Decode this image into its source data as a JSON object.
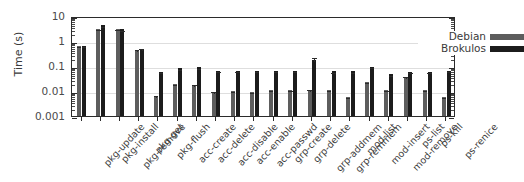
{
  "chart_data": {
    "type": "bar",
    "title": "",
    "xlabel": "",
    "ylabel": "Time (s)",
    "yscale": "log",
    "ylim": [
      0.001,
      10
    ],
    "ytick_labels": [
      "10",
      "1",
      "0.1",
      "0.01",
      "0.001"
    ],
    "ytick_values": [
      10,
      1,
      0.1,
      0.01,
      0.001
    ],
    "grid": true,
    "legend_position": "top-right",
    "categories": [
      "pkg-update",
      "pkg-install",
      "pkg-remove",
      "pkg-get",
      "pkg-flush",
      "acc-create",
      "acc-delete",
      "acc-disable",
      "acc-enable",
      "acc-passwd",
      "grp-create",
      "grp-delete",
      "grp-addmem",
      "grp-remmem",
      "mod-list",
      "mod-insert",
      "mod-remove",
      "ps-list",
      "ps-kill",
      "ps-renice"
    ],
    "series": [
      {
        "name": "Debian",
        "color": "#5d5d5d",
        "values": [
          0.63,
          3.1,
          2.9,
          0.45,
          0.0065,
          0.019,
          0.018,
          0.0095,
          0.0097,
          0.0093,
          0.011,
          0.011,
          0.011,
          0.011,
          0.0058,
          0.023,
          0.0105,
          0.036,
          0.0105,
          0.0056
        ],
        "errors": [
          0.07,
          0.35,
          0.3,
          0.06,
          0.0008,
          0.002,
          0.002,
          0.001,
          0.001,
          0.001,
          0.0012,
          0.0012,
          0.0018,
          0.0012,
          0.0006,
          0.003,
          0.0012,
          0.006,
          0.0012,
          0.0006
        ]
      },
      {
        "name": "Brokulos",
        "color": "#1c1c1c",
        "values": [
          0.65,
          4.2,
          2.9,
          0.5,
          0.06,
          0.082,
          0.088,
          0.064,
          0.063,
          0.064,
          0.063,
          0.063,
          0.175,
          0.062,
          0.062,
          0.09,
          0.046,
          0.06,
          0.06,
          0.065
        ],
        "errors": [
          0.04,
          0.3,
          0.2,
          0.05,
          0.004,
          0.005,
          0.006,
          0.004,
          0.004,
          0.004,
          0.004,
          0.004,
          0.065,
          0.004,
          0.004,
          0.006,
          0.003,
          0.004,
          0.004,
          0.004
        ]
      }
    ]
  },
  "legend": {
    "items": [
      {
        "label": "Debian"
      },
      {
        "label": "Brokulos"
      }
    ]
  },
  "axes": {
    "y_title": "Time (s)"
  }
}
